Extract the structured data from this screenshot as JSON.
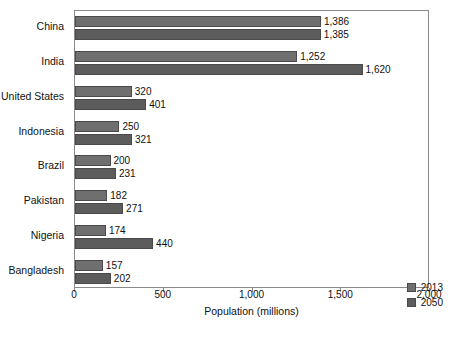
{
  "chart_data": {
    "type": "bar",
    "orientation": "horizontal",
    "title": "",
    "xlabel": "Population (millions)",
    "ylabel": "",
    "xlim": [
      0,
      2000
    ],
    "xticks": [
      0,
      500,
      1000,
      1500,
      2000
    ],
    "xtick_labels": [
      "0",
      "500",
      "1,000",
      "1,500",
      "2,000"
    ],
    "grid": false,
    "legend_position": "bottom-right",
    "categories": [
      "China",
      "India",
      "United States",
      "Indonesia",
      "Brazil",
      "Pakistan",
      "Nigeria",
      "Bangladesh"
    ],
    "series": [
      {
        "name": "2013",
        "color": "#6f6f6f",
        "values": [
          1386,
          1252,
          320,
          250,
          200,
          182,
          174,
          157
        ],
        "labels": [
          "1,386",
          "1,252",
          "320",
          "250",
          "200",
          "182",
          "174",
          "157"
        ]
      },
      {
        "name": "2050",
        "color": "#5c5c5c",
        "values": [
          1385,
          1620,
          401,
          321,
          231,
          271,
          440,
          202
        ],
        "labels": [
          "1,385",
          "1,620",
          "401",
          "321",
          "231",
          "271",
          "440",
          "202"
        ]
      }
    ]
  }
}
